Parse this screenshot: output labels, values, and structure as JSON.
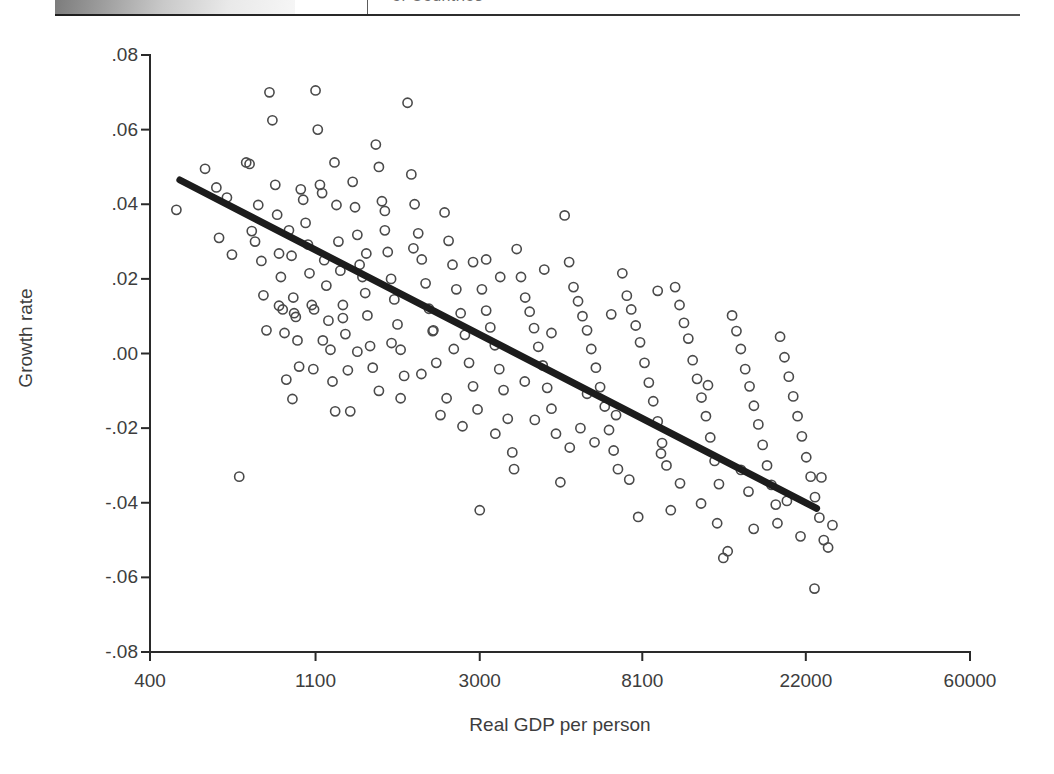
{
  "header": {
    "title_fragment": "of Countries"
  },
  "chart_data": {
    "type": "scatter",
    "title": "",
    "xlabel": "Real GDP per person",
    "ylabel": "Growth rate",
    "x_scale": "log",
    "x_ticks": [
      400,
      1100,
      3000,
      8100,
      22000,
      60000
    ],
    "x_tick_labels": [
      "400",
      "1100",
      "3000",
      "8100",
      "22000",
      "60000"
    ],
    "y_ticks": [
      0.08,
      0.06,
      0.04,
      0.02,
      0.0,
      -0.02,
      -0.04,
      -0.06,
      -0.08
    ],
    "y_tick_labels": [
      ".08",
      ".06",
      ".04",
      ".02",
      ".00",
      "-.02",
      "-.04",
      "-.06",
      "-.08"
    ],
    "xlim": [
      400,
      60000
    ],
    "ylim": [
      -0.08,
      0.08
    ],
    "grid": false,
    "legend": null,
    "marker": {
      "shape": "open-circle",
      "radius": 4.6,
      "stroke": "#4a4a4a",
      "fill": "none"
    },
    "trendline": {
      "type": "linear-on-log-x",
      "color": "#1c1c1c",
      "width": 7,
      "x_start": 480,
      "y_start": 0.0465,
      "x_end": 23500,
      "y_end": -0.0415
    },
    "points": [
      [
        470,
        0.0385
      ],
      [
        560,
        0.0495
      ],
      [
        600,
        0.0445
      ],
      [
        610,
        0.031
      ],
      [
        640,
        0.0418
      ],
      [
        660,
        0.0265
      ],
      [
        690,
        -0.033
      ],
      [
        720,
        0.0512
      ],
      [
        735,
        0.0508
      ],
      [
        745,
        0.0328
      ],
      [
        760,
        0.03
      ],
      [
        775,
        0.0398
      ],
      [
        790,
        0.0248
      ],
      [
        800,
        0.0156
      ],
      [
        815,
        0.0062
      ],
      [
        830,
        0.07
      ],
      [
        845,
        0.0625
      ],
      [
        860,
        0.0452
      ],
      [
        870,
        0.0372
      ],
      [
        880,
        0.0268
      ],
      [
        890,
        0.0205
      ],
      [
        900,
        0.0118
      ],
      [
        910,
        0.0055
      ],
      [
        920,
        -0.007
      ],
      [
        935,
        0.033
      ],
      [
        950,
        0.0262
      ],
      [
        960,
        0.015
      ],
      [
        965,
        0.0108
      ],
      [
        975,
        0.0098
      ],
      [
        985,
        0.0035
      ],
      [
        995,
        -0.0035
      ],
      [
        1005,
        0.044
      ],
      [
        1020,
        0.0412
      ],
      [
        1035,
        0.035
      ],
      [
        1050,
        0.0292
      ],
      [
        1060,
        0.0215
      ],
      [
        1075,
        0.013
      ],
      [
        1090,
        0.0118
      ],
      [
        1100,
        0.0705
      ],
      [
        1115,
        0.06
      ],
      [
        1130,
        0.0452
      ],
      [
        1145,
        0.043
      ],
      [
        1160,
        0.025
      ],
      [
        1175,
        0.0182
      ],
      [
        1190,
        0.0088
      ],
      [
        1205,
        0.001
      ],
      [
        1220,
        -0.0075
      ],
      [
        1235,
        0.0512
      ],
      [
        1250,
        0.0398
      ],
      [
        1265,
        0.03
      ],
      [
        1280,
        0.0222
      ],
      [
        1300,
        0.013
      ],
      [
        1320,
        0.0052
      ],
      [
        1340,
        -0.0045
      ],
      [
        1360,
        -0.0155
      ],
      [
        1380,
        0.046
      ],
      [
        1400,
        0.0392
      ],
      [
        1420,
        0.0318
      ],
      [
        1440,
        0.0238
      ],
      [
        1465,
        0.0205
      ],
      [
        1490,
        0.0162
      ],
      [
        1510,
        0.0102
      ],
      [
        1535,
        0.002
      ],
      [
        1560,
        -0.0038
      ],
      [
        1590,
        0.056
      ],
      [
        1620,
        0.05
      ],
      [
        1650,
        0.0408
      ],
      [
        1680,
        0.033
      ],
      [
        1710,
        0.0272
      ],
      [
        1745,
        0.02
      ],
      [
        1780,
        0.0145
      ],
      [
        1815,
        0.0078
      ],
      [
        1850,
        0.001
      ],
      [
        1890,
        -0.006
      ],
      [
        1930,
        0.0672
      ],
      [
        1975,
        0.048
      ],
      [
        2015,
        0.04
      ],
      [
        2060,
        0.0322
      ],
      [
        2105,
        0.0252
      ],
      [
        2155,
        0.0188
      ],
      [
        2200,
        0.012
      ],
      [
        2250,
        0.006
      ],
      [
        2300,
        -0.0025
      ],
      [
        2360,
        -0.0165
      ],
      [
        2420,
        0.0378
      ],
      [
        2480,
        0.0302
      ],
      [
        2540,
        0.0238
      ],
      [
        2600,
        0.0172
      ],
      [
        2670,
        0.0108
      ],
      [
        2740,
        0.005
      ],
      [
        2810,
        -0.0025
      ],
      [
        2880,
        -0.0088
      ],
      [
        2960,
        -0.015
      ],
      [
        3000,
        -0.042
      ],
      [
        3040,
        0.0172
      ],
      [
        3120,
        0.0115
      ],
      [
        3200,
        0.007
      ],
      [
        3290,
        0.0022
      ],
      [
        3380,
        -0.0042
      ],
      [
        3470,
        -0.0098
      ],
      [
        3560,
        -0.0175
      ],
      [
        3660,
        -0.0265
      ],
      [
        3760,
        0.028
      ],
      [
        3860,
        0.0205
      ],
      [
        3960,
        0.015
      ],
      [
        4070,
        0.0112
      ],
      [
        4180,
        0.0068
      ],
      [
        4290,
        0.0018
      ],
      [
        4410,
        -0.0032
      ],
      [
        4530,
        -0.0092
      ],
      [
        4650,
        -0.0148
      ],
      [
        4780,
        -0.0215
      ],
      [
        4910,
        -0.0345
      ],
      [
        5040,
        0.037
      ],
      [
        5180,
        0.0245
      ],
      [
        5320,
        0.0178
      ],
      [
        5470,
        0.014
      ],
      [
        5620,
        0.01
      ],
      [
        5780,
        0.0062
      ],
      [
        5930,
        0.0012
      ],
      [
        6100,
        -0.0038
      ],
      [
        6260,
        -0.009
      ],
      [
        6440,
        -0.0142
      ],
      [
        6610,
        -0.0205
      ],
      [
        6800,
        -0.026
      ],
      [
        6980,
        -0.031
      ],
      [
        7170,
        0.0215
      ],
      [
        7370,
        0.0155
      ],
      [
        7570,
        0.0118
      ],
      [
        7780,
        0.0075
      ],
      [
        7990,
        0.003
      ],
      [
        8210,
        -0.0025
      ],
      [
        8430,
        -0.0078
      ],
      [
        8660,
        -0.0128
      ],
      [
        8900,
        -0.0182
      ],
      [
        9140,
        -0.024
      ],
      [
        9390,
        -0.03
      ],
      [
        9640,
        -0.042
      ],
      [
        9900,
        0.0178
      ],
      [
        10170,
        0.013
      ],
      [
        10450,
        0.0082
      ],
      [
        10730,
        0.004
      ],
      [
        11020,
        -0.0018
      ],
      [
        11320,
        -0.0068
      ],
      [
        11630,
        -0.0118
      ],
      [
        11950,
        -0.0168
      ],
      [
        12270,
        -0.0225
      ],
      [
        12600,
        -0.0288
      ],
      [
        12940,
        -0.035
      ],
      [
        13290,
        -0.0548
      ],
      [
        13650,
        -0.053
      ],
      [
        14020,
        0.0102
      ],
      [
        14400,
        0.006
      ],
      [
        14790,
        0.0012
      ],
      [
        15190,
        -0.0042
      ],
      [
        15600,
        -0.0088
      ],
      [
        16020,
        -0.014
      ],
      [
        16460,
        -0.019
      ],
      [
        16900,
        -0.0245
      ],
      [
        17360,
        -0.03
      ],
      [
        17830,
        -0.0352
      ],
      [
        18310,
        -0.0405
      ],
      [
        18800,
        0.0045
      ],
      [
        19310,
        -0.001
      ],
      [
        19830,
        -0.0062
      ],
      [
        20370,
        -0.0115
      ],
      [
        20920,
        -0.0168
      ],
      [
        21480,
        -0.0222
      ],
      [
        22060,
        -0.0278
      ],
      [
        22660,
        -0.033
      ],
      [
        23270,
        -0.0385
      ],
      [
        23900,
        -0.044
      ],
      [
        24550,
        -0.05
      ],
      [
        25210,
        -0.052
      ],
      [
        25890,
        -0.046
      ],
      [
        23200,
        -0.063
      ],
      [
        5550,
        -0.02
      ],
      [
        6050,
        -0.0238
      ],
      [
        4650,
        0.0055
      ],
      [
        3950,
        -0.0075
      ],
      [
        3400,
        0.0205
      ],
      [
        2880,
        0.0245
      ],
      [
        2450,
        -0.012
      ],
      [
        2100,
        -0.0055
      ],
      [
        1850,
        -0.012
      ],
      [
        1620,
        -0.01
      ],
      [
        1420,
        0.0005
      ],
      [
        1240,
        -0.0155
      ],
      [
        1085,
        -0.0042
      ],
      [
        955,
        -0.0122
      ],
      [
        1680,
        0.0382
      ],
      [
        2260,
        0.0062
      ],
      [
        3120,
        0.0252
      ],
      [
        4200,
        -0.0178
      ],
      [
        5780,
        -0.0108
      ],
      [
        7480,
        -0.0338
      ],
      [
        9080,
        -0.0268
      ],
      [
        11600,
        -0.0402
      ],
      [
        14800,
        -0.0312
      ],
      [
        18500,
        -0.0455
      ],
      [
        21300,
        -0.049
      ],
      [
        8900,
        0.0168
      ],
      [
        6700,
        0.0105
      ],
      [
        10200,
        -0.0348
      ],
      [
        12800,
        -0.0455
      ],
      [
        16000,
        -0.047
      ],
      [
        7900,
        -0.0438
      ],
      [
        5200,
        -0.0252
      ],
      [
        3700,
        -0.031
      ],
      [
        2700,
        -0.0195
      ],
      [
        2000,
        0.0282
      ],
      [
        1500,
        0.0268
      ],
      [
        1150,
        0.0035
      ],
      [
        880,
        0.0128
      ],
      [
        1300,
        0.0095
      ],
      [
        2560,
        0.0012
      ],
      [
        4450,
        0.0225
      ],
      [
        6900,
        -0.0165
      ],
      [
        12100,
        -0.0085
      ],
      [
        15500,
        -0.037
      ],
      [
        19600,
        -0.0395
      ],
      [
        24200,
        -0.0332
      ],
      [
        1750,
        0.0028
      ],
      [
        3300,
        -0.0215
      ]
    ]
  }
}
